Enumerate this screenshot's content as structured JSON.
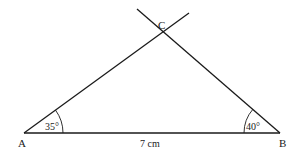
{
  "diagram": {
    "type": "triangle-construction",
    "vertices": {
      "A": {
        "label": "A",
        "x": 24,
        "y": 133
      },
      "B": {
        "label": "B",
        "x": 280,
        "y": 133
      },
      "C": {
        "label": "C",
        "x": 163,
        "y": 31
      }
    },
    "base_length_label": "7 cm",
    "angle_A_label": "35°",
    "angle_B_label": "40°",
    "line_color": "#1a1a1a"
  }
}
